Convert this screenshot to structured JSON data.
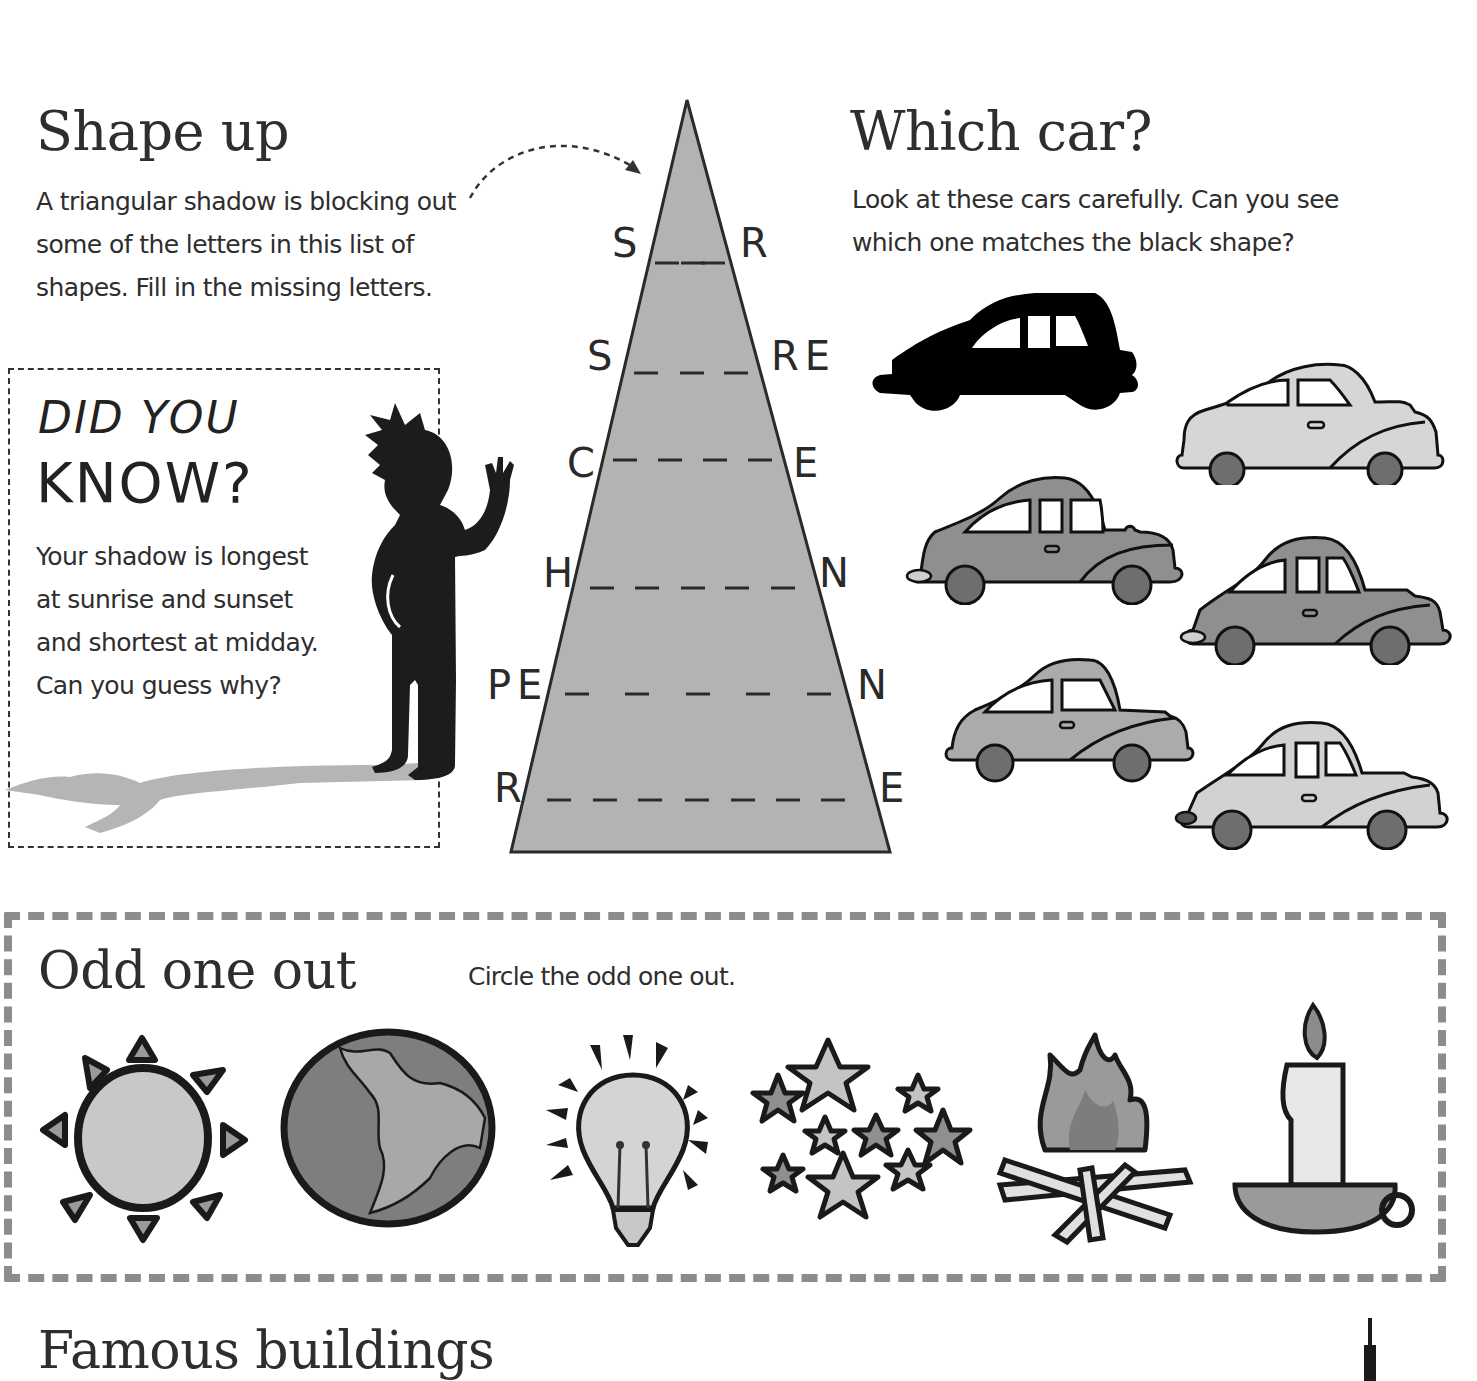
{
  "shape_up": {
    "title": "Shape up",
    "instructions": [
      "A triangular shadow is blocking out",
      "some of the letters in this list of",
      "shapes. Fill in the missing letters."
    ],
    "rows": [
      {
        "left": "S",
        "blanks": 2,
        "right": "R"
      },
      {
        "left": "S",
        "blanks": 3,
        "right": "RE"
      },
      {
        "left": "C",
        "blanks": 4,
        "right": "E"
      },
      {
        "left": "H",
        "blanks": 5,
        "right": "N"
      },
      {
        "left": "PE",
        "blanks": 5,
        "right": "N"
      },
      {
        "left": "R",
        "blanks": 7,
        "right": "E"
      }
    ],
    "triangle_color": "#b3b3b3"
  },
  "did_you_know": {
    "heading_line1": "DID YOU",
    "heading_line2": "KNOW?",
    "text": [
      "Your shadow is longest",
      "at sunrise and sunset",
      "and shortest at midday.",
      "Can you guess why?"
    ],
    "shadow_color": "#b5b5b5"
  },
  "which_car": {
    "title": "Which car?",
    "instructions": [
      "Look at these cars carefully. Can you see",
      "which one matches the black shape?"
    ],
    "cars": [
      {
        "id": "silhouette",
        "fill": "#000000"
      },
      {
        "id": "car-1",
        "fill": "#d6d6d6"
      },
      {
        "id": "car-2",
        "fill": "#8f8f8f"
      },
      {
        "id": "car-3",
        "fill": "#8f8f8f"
      },
      {
        "id": "car-4",
        "fill": "#ababab"
      },
      {
        "id": "car-5",
        "fill": "#d2d2d2"
      }
    ]
  },
  "odd_one_out": {
    "title": "Odd one out",
    "instruction": "Circle the odd one out.",
    "items": [
      "sun",
      "earth",
      "light bulb",
      "stars",
      "campfire",
      "candle"
    ],
    "border_color": "#8c8c8c"
  },
  "famous_buildings": {
    "title": "Famous buildings"
  }
}
